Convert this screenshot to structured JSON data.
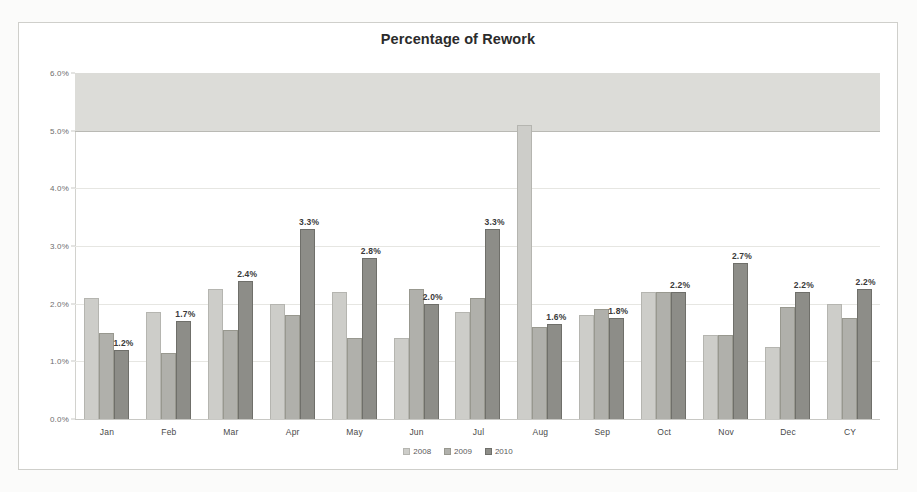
{
  "chart_data": {
    "type": "bar",
    "title": "Percentage of Rework",
    "xlabel": "",
    "ylabel": "",
    "ylim": [
      0,
      6
    ],
    "ytick_labels": [
      "0.0%",
      "1.0%",
      "2.0%",
      "3.0%",
      "4.0%",
      "5.0%",
      "6.0%"
    ],
    "ytick_values": [
      0,
      1,
      2,
      3,
      4,
      5,
      6
    ],
    "grid": true,
    "legend_position": "bottom",
    "categories": [
      "Jan",
      "Feb",
      "Mar",
      "Apr",
      "May",
      "Jun",
      "Jul",
      "Aug",
      "Sep",
      "Oct",
      "Nov",
      "Dec",
      "CY"
    ],
    "series": [
      {
        "name": "2008",
        "color": "#cdcdc9",
        "values": [
          2.1,
          1.85,
          2.25,
          2.0,
          2.2,
          1.4,
          1.85,
          5.1,
          1.8,
          2.2,
          1.45,
          1.25,
          2.0
        ]
      },
      {
        "name": "2009",
        "color": "#b0b0ab",
        "values": [
          1.5,
          1.15,
          1.55,
          1.8,
          1.4,
          2.25,
          2.1,
          1.6,
          1.9,
          2.2,
          1.45,
          1.95,
          1.75
        ]
      },
      {
        "name": "2010",
        "color": "#8d8d88",
        "values": [
          1.2,
          1.7,
          2.4,
          3.3,
          2.8,
          2.0,
          3.3,
          1.65,
          1.75,
          2.2,
          2.7,
          2.2,
          2.25
        ]
      }
    ],
    "data_labels": [
      "1.2%",
      "1.7%",
      "2.4%",
      "3.3%",
      "2.8%",
      "2.0%",
      "3.3%",
      "1.6%",
      "1.8%",
      "2.2%",
      "2.7%",
      "2.2%",
      "2.2%"
    ],
    "shaded_band": {
      "from": 5.0,
      "to": 6.0
    }
  },
  "legend": {
    "items": [
      {
        "label": "2008"
      },
      {
        "label": "2009"
      },
      {
        "label": "2010"
      }
    ]
  }
}
